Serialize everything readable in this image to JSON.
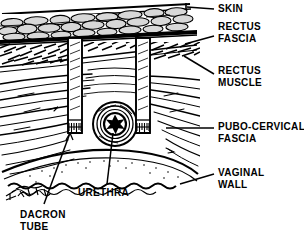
{
  "figure": {
    "background_color": "#ffffff",
    "ink_color": "#000000",
    "width": 304,
    "height": 238
  },
  "labels": [
    {
      "id": "skin",
      "text": "SKIN",
      "x": 218,
      "y": 4,
      "lines": [
        "SKIN"
      ]
    },
    {
      "id": "rectus-fascia",
      "text": "RECTUS\nFASCIA",
      "x": 218,
      "y": 22,
      "lines": [
        "RECTUS",
        "FASCIA"
      ]
    },
    {
      "id": "rectus-muscle",
      "text": "RECTUS\nMUSCLE",
      "x": 218,
      "y": 66,
      "lines": [
        "RECTUS",
        "MUSCLE"
      ]
    },
    {
      "id": "pubo-cervical-fascia",
      "text": "PUBO-CERVICAL\nFASCIA",
      "x": 218,
      "y": 122,
      "lines": [
        "PUBO-CERVICAL",
        "FASCIA"
      ]
    },
    {
      "id": "vaginal-wall",
      "text": "VAGINAL\nWALL",
      "x": 218,
      "y": 168,
      "lines": [
        "VAGINAL",
        "WALL"
      ]
    },
    {
      "id": "urethra",
      "text": "URETHRA",
      "x": 78,
      "y": 188,
      "lines": [
        "URETHRA"
      ]
    },
    {
      "id": "dacron-tube",
      "text": "DACRON\nTUBE",
      "x": 20,
      "y": 210,
      "lines": [
        "DACRON",
        "TUBE"
      ]
    }
  ],
  "anatomy": {
    "layers": [
      {
        "name": "skin",
        "description": "thin double line across the top of the section"
      },
      {
        "name": "subcutaneous-fat",
        "description": "cobblestone lobules between skin and rectus fascia"
      },
      {
        "name": "rectus-fascia",
        "description": "dense horizontal band below the fat"
      },
      {
        "name": "rectus-muscle",
        "description": "dark cross-hatched muscle belly on both sides"
      },
      {
        "name": "pubo-cervical-fascia",
        "description": "flowing curvilinear fibres sweeping toward the urethra"
      },
      {
        "name": "vaginal-wall",
        "description": "wavy scalloped arc with stippling at the lower border"
      }
    ],
    "structures": [
      {
        "name": "urethra",
        "description": "concentric ring lumen with black stellate opening",
        "cx": 115,
        "cy": 124,
        "r": 22
      },
      {
        "name": "dacron-tube-left",
        "description": "vertical sling tube passing through fascia and muscle",
        "x": 68,
        "y": 38,
        "w": 14,
        "h": 95
      },
      {
        "name": "dacron-tube-right",
        "description": "vertical sling tube passing through fascia and muscle",
        "x": 136,
        "y": 38,
        "w": 14,
        "h": 95
      }
    ],
    "signature": {
      "name": "artist-signature",
      "x": 8,
      "y": 186
    }
  },
  "leaders": [
    {
      "id": "leader-skin",
      "from": [
        214,
        9
      ],
      "to": [
        186,
        7
      ]
    },
    {
      "id": "leader-rectus-fascia",
      "from": [
        214,
        36
      ],
      "to": [
        184,
        44
      ]
    },
    {
      "id": "leader-rectus-muscle",
      "from": [
        214,
        74
      ],
      "to": [
        182,
        56
      ]
    },
    {
      "id": "leader-pubo-fascia",
      "from": [
        214,
        128
      ],
      "to": [
        168,
        128
      ]
    },
    {
      "id": "leader-vaginal-wall",
      "from": [
        214,
        174
      ],
      "to": [
        178,
        184
      ]
    },
    {
      "id": "leader-urethra",
      "from": [
        104,
        185
      ],
      "to": [
        112,
        132
      ]
    },
    {
      "id": "leader-dacron-tube",
      "from": [
        44,
        204
      ],
      "to": [
        70,
        132
      ]
    }
  ]
}
